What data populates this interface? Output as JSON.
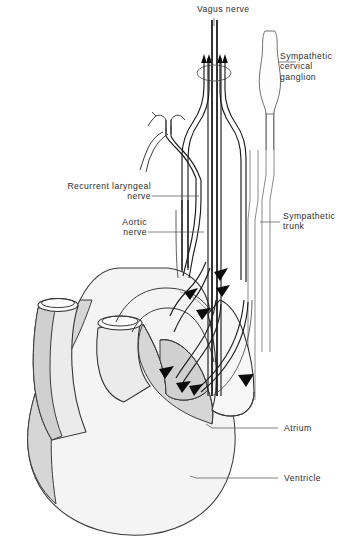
{
  "figure": {
    "type": "anatomical-line-diagram",
    "background_color": "#ffffff",
    "ink_color": "#2b2b2b",
    "shade_color": "#d6d6d6",
    "fill_color": "#f4f4f4"
  },
  "labels": {
    "vagus_nerve": "Vagus nerve",
    "sympathetic_cervical_ganglion_line1": "Sympathetic",
    "sympathetic_cervical_ganglion_line2": "cervical",
    "sympathetic_cervical_ganglion_line3": "ganglion",
    "recurrent_laryngeal_line1": "Recurrent  laryngeal",
    "recurrent_laryngeal_line2": "nerve",
    "aortic_nerve_line1": "Aortic",
    "aortic_nerve_line2": "nerve",
    "sympathetic_trunk_line1": "Sympathetic",
    "sympathetic_trunk_line2": "trunk",
    "atrium": "Atrium",
    "ventricle": "Ventricle"
  },
  "structures": [
    {
      "name": "vagus-nerve",
      "label": "Vagus nerve",
      "side": "top-center",
      "description": "thick dark nerve trunk descending from top centre"
    },
    {
      "name": "sympathetic-cervical-ganglion",
      "label": "Sympathetic cervical ganglion",
      "side": "top-right",
      "description": "fusiform spindle-shaped swelling on the right trunk"
    },
    {
      "name": "recurrent-laryngeal-nerve",
      "label": "Recurrent laryngeal nerve",
      "side": "left",
      "description": "nerve looping up with a branched Y-shaped termination"
    },
    {
      "name": "aortic-nerve",
      "label": "Aortic nerve",
      "side": "left",
      "description": "nerve running down to the aortic arch"
    },
    {
      "name": "sympathetic-trunk",
      "label": "Sympathetic trunk",
      "side": "right",
      "description": "paired pale vertical trunk lines on the right"
    },
    {
      "name": "atrium",
      "label": "Atrium",
      "side": "lower-right",
      "description": "shaded auricular appendage of the heart"
    },
    {
      "name": "ventricle",
      "label": "Ventricle",
      "side": "lower-right",
      "description": "large rounded lower chamber of the heart"
    }
  ],
  "annotation_arrows": {
    "afferent_upward_count": 4,
    "efferent_downward_count": 8,
    "description": "Solid black arrowheads indicate direction of nerve impulse conduction"
  }
}
